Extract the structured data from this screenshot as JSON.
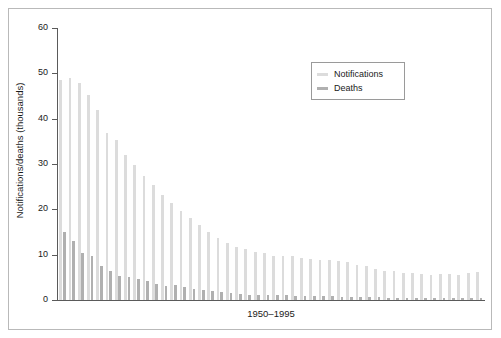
{
  "chart_data": {
    "type": "bar",
    "title": "",
    "subtitle": "",
    "xlabel": "1950–1995",
    "ylabel": "Notifications/deaths (thousands)",
    "ylim": [
      0,
      60
    ],
    "yticks": [
      0,
      10,
      20,
      30,
      40,
      50,
      60
    ],
    "ytick_labels": [
      "0",
      "10",
      "20",
      "30",
      "40",
      "50",
      "60"
    ],
    "grid": false,
    "legend_position": "top-right",
    "categories": [
      "1950",
      "1951",
      "1952",
      "1953",
      "1954",
      "1955",
      "1956",
      "1957",
      "1958",
      "1959",
      "1960",
      "1961",
      "1962",
      "1963",
      "1964",
      "1965",
      "1966",
      "1967",
      "1968",
      "1969",
      "1970",
      "1971",
      "1972",
      "1973",
      "1974",
      "1975",
      "1976",
      "1977",
      "1978",
      "1979",
      "1980",
      "1981",
      "1982",
      "1983",
      "1984",
      "1985",
      "1986",
      "1987",
      "1988",
      "1989",
      "1990",
      "1991",
      "1992",
      "1993",
      "1994",
      "1995"
    ],
    "series": [
      {
        "name": "Notifications",
        "color": "#dcdcdc",
        "values": [
          48.5,
          49.0,
          47.8,
          45.2,
          41.9,
          36.8,
          35.2,
          32.0,
          29.8,
          27.4,
          25.3,
          23.2,
          21.5,
          19.6,
          18.0,
          16.5,
          15.0,
          13.6,
          12.6,
          11.6,
          11.2,
          10.6,
          10.4,
          9.8,
          9.6,
          9.8,
          9.2,
          9.0,
          8.9,
          8.8,
          8.6,
          8.4,
          7.8,
          7.4,
          6.8,
          6.4,
          6.3,
          6.0,
          5.9,
          5.8,
          5.6,
          5.8,
          5.8,
          5.6,
          6.0,
          6.2
        ]
      },
      {
        "name": "Deaths",
        "color": "#b0b0b0",
        "values": [
          15.0,
          13.0,
          10.4,
          9.6,
          7.4,
          6.4,
          5.4,
          5.0,
          4.6,
          4.3,
          3.6,
          3.2,
          3.4,
          2.8,
          2.5,
          2.2,
          1.9,
          1.7,
          1.5,
          1.4,
          1.2,
          1.2,
          1.1,
          1.0,
          1.0,
          0.9,
          0.9,
          0.8,
          0.8,
          0.8,
          0.7,
          0.7,
          0.6,
          0.6,
          0.6,
          0.5,
          0.5,
          0.5,
          0.5,
          0.5,
          0.5,
          0.4,
          0.4,
          0.4,
          0.4,
          0.4
        ]
      }
    ]
  },
  "legend": {
    "entries": [
      {
        "label": "Notifications",
        "color": "#dcdcdc"
      },
      {
        "label": "Deaths",
        "color": "#b0b0b0"
      }
    ]
  },
  "axes": {
    "y_title": "Notifications/deaths (thousands)",
    "x_title": "1950–1995"
  }
}
